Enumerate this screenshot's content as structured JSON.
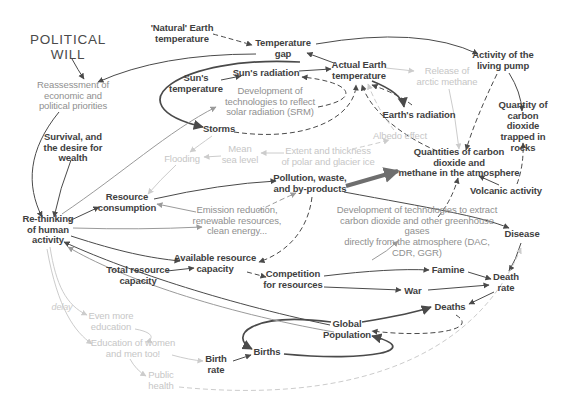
{
  "diagram": {
    "colors": {
      "background": "#ffffff",
      "dark_text": "#3f3f3f",
      "gray_text": "#8f8f8f",
      "light_text": "#c6c6c6",
      "dark_line": "#4a4a4a",
      "gray_line": "#9a9a9a",
      "light_line": "#cccccc",
      "thick_line": "#6e6e6e"
    },
    "nodes": [
      {
        "id": "political-will",
        "label": "POLITICAL\nWILL",
        "x": 68,
        "y": 47,
        "style": "title"
      },
      {
        "id": "natural-earth-temperature",
        "label": "'Natural' Earth\ntemperature",
        "x": 182,
        "y": 34,
        "style": "dark"
      },
      {
        "id": "temperature-gap",
        "label": "Temperature\ngap",
        "x": 283,
        "y": 49,
        "style": "dark"
      },
      {
        "id": "suns-temperature",
        "label": "Sun's\ntemperature",
        "x": 196,
        "y": 84,
        "style": "dark"
      },
      {
        "id": "suns-radiation",
        "label": "Sun's radiation",
        "x": 266,
        "y": 73,
        "style": "dark"
      },
      {
        "id": "actual-earth-temperature",
        "label": "Actual Earth\ntemperature",
        "x": 359,
        "y": 71,
        "style": "dark"
      },
      {
        "id": "release-of-arctic-methane",
        "label": "Release of\narctic methane",
        "x": 447,
        "y": 77,
        "style": "light"
      },
      {
        "id": "activity-of-living-pump",
        "label": "Activity of the\nliving pump",
        "x": 503,
        "y": 61,
        "style": "dark"
      },
      {
        "id": "reassessment-priorities",
        "label": "Reassessment of\neconomic and\npolitical priorities",
        "x": 73,
        "y": 96,
        "style": "gray"
      },
      {
        "id": "srm-technologies",
        "label": "Development of\ntechnologies to reflect\nsolar radiation (SRM)",
        "x": 270,
        "y": 102,
        "style": "gray"
      },
      {
        "id": "earths-radiation",
        "label": "Earth's radiation",
        "x": 419,
        "y": 115,
        "style": "dark"
      },
      {
        "id": "co2-trapped-in-rocks",
        "label": "Quantity of\ncarbon dioxide\ntrapped in rocks",
        "x": 523,
        "y": 127,
        "style": "dark"
      },
      {
        "id": "storms",
        "label": "Storms",
        "x": 219,
        "y": 129,
        "style": "dark"
      },
      {
        "id": "survival-desire-wealth",
        "label": "Survival, and\nthe desire for\nwealth",
        "x": 73,
        "y": 148,
        "style": "dark"
      },
      {
        "id": "albedo-effect",
        "label": "Albedo effect",
        "x": 400,
        "y": 136,
        "style": "light"
      },
      {
        "id": "mean-sea-level",
        "label": "Mean\nsea level",
        "x": 240,
        "y": 155,
        "style": "light"
      },
      {
        "id": "polar-glacier-ice",
        "label": "Extent and thickness\nof polar and glacier ice",
        "x": 328,
        "y": 157,
        "style": "light"
      },
      {
        "id": "flooding",
        "label": "Flooding",
        "x": 182,
        "y": 159,
        "style": "light"
      },
      {
        "id": "co2-methane-atmosphere",
        "label": "Quantities of carbon dioxide and\nmethane in the atmosphere",
        "x": 459,
        "y": 163,
        "style": "dark"
      },
      {
        "id": "pollution-waste",
        "label": "Pollution, waste,\nand by-products",
        "x": 310,
        "y": 184,
        "style": "dark"
      },
      {
        "id": "volcanic-activity",
        "label": "Volcanic activity",
        "x": 506,
        "y": 191,
        "style": "dark"
      },
      {
        "id": "resource-consumption",
        "label": "Resource\nconsumption",
        "x": 127,
        "y": 203,
        "style": "dark"
      },
      {
        "id": "emission-reduction",
        "label": "Emission reduction,\nrenewable resources,\nclean energy...",
        "x": 237,
        "y": 221,
        "style": "gray"
      },
      {
        "id": "rethinking-human-activity",
        "label": "Re-thinking\nof human\nactivity",
        "x": 48,
        "y": 230,
        "style": "dark"
      },
      {
        "id": "dac-technologies",
        "label": "Development of technologies to extract\ncarbon dioxide and other greenhouse gases\ndirectly from the atmosphere (DAC, CDR, GGR)",
        "x": 417,
        "y": 232,
        "style": "gray"
      },
      {
        "id": "disease",
        "label": "Disease",
        "x": 522,
        "y": 234,
        "style": "dark"
      },
      {
        "id": "available-resource-capacity",
        "label": "Available resource\ncapacity",
        "x": 215,
        "y": 264,
        "style": "dark"
      },
      {
        "id": "total-resource-capacity",
        "label": "Total resource\ncapacity",
        "x": 138,
        "y": 276,
        "style": "dark"
      },
      {
        "id": "competition-for-resources",
        "label": "Competition\nfor resources",
        "x": 293,
        "y": 280,
        "style": "dark"
      },
      {
        "id": "famine",
        "label": "Famine",
        "x": 448,
        "y": 270,
        "style": "dark"
      },
      {
        "id": "death-rate",
        "label": "Death\nrate",
        "x": 506,
        "y": 283,
        "style": "dark"
      },
      {
        "id": "war",
        "label": "War",
        "x": 413,
        "y": 291,
        "style": "dark"
      },
      {
        "id": "deaths",
        "label": "Deaths",
        "x": 450,
        "y": 307,
        "style": "dark"
      },
      {
        "id": "delay-note",
        "label": "delay",
        "x": 62,
        "y": 307,
        "style": "lightitalic"
      },
      {
        "id": "even-more-education",
        "label": "Even more\neducation",
        "x": 111,
        "y": 322,
        "style": "light"
      },
      {
        "id": "global-population",
        "label": "Global\nPopulation",
        "x": 347,
        "y": 330,
        "style": "dark"
      },
      {
        "id": "education-of-women",
        "label": "Education of women\nand men too!",
        "x": 133,
        "y": 349,
        "style": "light"
      },
      {
        "id": "births",
        "label": "Births",
        "x": 267,
        "y": 352,
        "style": "dark"
      },
      {
        "id": "birth-rate",
        "label": "Birth\nrate",
        "x": 216,
        "y": 365,
        "style": "dark"
      },
      {
        "id": "public-health",
        "label": "Public\nhealth",
        "x": 161,
        "y": 381,
        "style": "light"
      }
    ],
    "edges": [
      {
        "from": "political-will",
        "to": "reassessment-priorities",
        "style": "sd",
        "d": "M 72 59 Q 78 70 84 79"
      },
      {
        "from": "temperature-gap",
        "to": "reassessment-priorities",
        "style": "sd",
        "d": "M 256 54 Q 160 54 98 82"
      },
      {
        "from": "suns-temperature",
        "to": "suns-radiation",
        "style": "sd",
        "d": "M 221 80 L 241 76"
      },
      {
        "from": "suns-radiation",
        "to": "actual-earth-temperature",
        "style": "sd",
        "d": "M 299 71 L 331 69"
      },
      {
        "from": "actual-earth-temperature",
        "to": "temperature-gap",
        "style": "sd",
        "d": "M 334 63 L 307 53"
      },
      {
        "from": "temperature-gap",
        "to": "activity-of-living-pump",
        "style": "sd",
        "d": "M 316 44 Q 420 26 478 54"
      },
      {
        "from": "natural-earth-temperature",
        "to": "temperature-gap",
        "style": "dd",
        "d": "M 213 34 Q 235 40 252 45"
      },
      {
        "from": "actual-earth-temperature",
        "to": "storms",
        "style": "sdt",
        "d": "M 300 62 C 180 55 110 105 203 127"
      },
      {
        "from": "storms",
        "to": "actual-earth-temperature",
        "style": "dd",
        "d": "M 234 132 C 310 143 355 115 356 85"
      },
      {
        "from": "srm-technologies",
        "to": "suns-radiation",
        "style": "dd",
        "d": "M 318 107 C 362 99 352 82 302 77"
      },
      {
        "from": "resource-consumption",
        "to": "pollution-waste",
        "style": "sd",
        "d": "M 154 199 Q 220 184 276 181"
      },
      {
        "from": "pollution-waste",
        "to": "co2-methane-atmosphere",
        "style": "thick",
        "d": "M 346 186 L 398 171"
      },
      {
        "from": "actual-earth-temperature",
        "to": "earths-radiation",
        "style": "sdt",
        "d": "M 372 81 Q 402 93 404 107"
      },
      {
        "from": "earths-radiation",
        "to": "actual-earth-temperature",
        "style": "dd",
        "d": "M 412 105 Q 398 94 372 85"
      },
      {
        "from": "co2-methane-atmosphere",
        "to": "actual-earth-temperature",
        "style": "dd",
        "d": "M 437 151 C 400 135 370 110 362 85"
      },
      {
        "from": "albedo-effect",
        "to": "actual-earth-temperature",
        "style": "dl",
        "d": "M 394 130 Q 378 110 368 84"
      },
      {
        "from": "polar-glacier-ice",
        "to": "albedo-effect",
        "style": "dl",
        "d": "M 352 149 Q 375 144 389 140"
      },
      {
        "from": "polar-glacier-ice",
        "to": "mean-sea-level",
        "style": "sl",
        "d": "M 284 153 L 261 153"
      },
      {
        "from": "mean-sea-level",
        "to": "flooding",
        "style": "sl",
        "d": "M 221 156 L 204 157"
      },
      {
        "from": "storms",
        "to": "flooding",
        "style": "sl",
        "d": "M 212 136 Q 198 146 190 152"
      },
      {
        "from": "flooding",
        "to": "resource-consumption",
        "style": "sl",
        "d": "M 176 165 Q 160 180 148 194"
      },
      {
        "from": "activity-of-living-pump",
        "to": "co2-trapped-in-rocks",
        "style": "sd",
        "d": "M 509 73 Q 521 92 522 111"
      },
      {
        "from": "activity-of-living-pump",
        "to": "co2-methane-atmosphere",
        "style": "dd",
        "d": "M 497 74 C 482 105 472 130 466 150"
      },
      {
        "from": "volcanic-activity",
        "to": "co2-methane-atmosphere",
        "style": "sd",
        "d": "M 499 185 L 479 176"
      },
      {
        "from": "volcanic-activity",
        "to": "co2-trapped-in-rocks",
        "style": "dd",
        "d": "M 517 184 Q 524 165 523 143"
      },
      {
        "from": "release-of-arctic-methane",
        "to": "co2-methane-atmosphere",
        "style": "sl",
        "d": "M 449 89 Q 456 120 459 149"
      },
      {
        "from": "actual-earth-temperature",
        "to": "release-of-arctic-methane",
        "style": "sl",
        "d": "M 386 68 L 414 71"
      },
      {
        "from": "pollution-waste",
        "to": "disease",
        "style": "sd",
        "d": "M 344 192 C 430 208 480 216 509 228"
      },
      {
        "from": "dac-technologies",
        "to": "co2-methane-atmosphere",
        "style": "dd",
        "d": "M 438 217 Q 452 200 458 178"
      },
      {
        "from": "rethinking-human-activity",
        "to": "dac-technologies",
        "style": "sg",
        "d": "M 372 260 Q 388 251 398 241"
      },
      {
        "from": "disease",
        "to": "death-rate",
        "style": "sd",
        "d": "M 521 243 Q 516 260 509 271"
      },
      {
        "from": "famine",
        "to": "death-rate",
        "style": "sd",
        "d": "M 468 272 L 491 279"
      },
      {
        "from": "war",
        "to": "death-rate",
        "style": "sd",
        "d": "M 428 290 L 489 285"
      },
      {
        "from": "competition-for-resources",
        "to": "famine",
        "style": "sd",
        "d": "M 324 276 Q 390 268 429 270"
      },
      {
        "from": "competition-for-resources",
        "to": "war",
        "style": "sd",
        "d": "M 324 287 L 401 290"
      },
      {
        "from": "available-resource-capacity",
        "to": "competition-for-resources",
        "style": "dd",
        "d": "M 247 272 L 266 277"
      },
      {
        "from": "total-resource-capacity",
        "to": "available-resource-capacity",
        "style": "sd",
        "d": "M 167 271 L 194 268"
      },
      {
        "from": "rethinking-human-activity",
        "to": "resource-consumption",
        "style": "sd",
        "d": "M 69 221 L 99 207"
      },
      {
        "from": "rethinking-human-activity",
        "to": "available-resource-capacity",
        "style": "sd",
        "d": "M 71 236 C 120 252 150 258 180 261"
      },
      {
        "from": "survival-desire-wealth",
        "to": "rethinking-human-activity",
        "style": "sd",
        "d": "M 71 160 Q 60 188 54 217"
      },
      {
        "from": "reassessment-priorities",
        "to": "rethinking-human-activity",
        "style": "sd",
        "d": "M 59 112 C 28 150 26 185 42 217"
      },
      {
        "from": "emission-reduction",
        "to": "resource-consumption",
        "style": "sg",
        "d": "M 196 212 L 157 204"
      },
      {
        "from": "rethinking-human-activity",
        "to": "emission-reduction",
        "style": "sg",
        "d": "M 73 228 Q 140 230 202 227"
      },
      {
        "from": "rethinking-human-activity",
        "to": "srm-technologies",
        "style": "sg",
        "d": "M 62 214 C 120 175 170 130 216 107"
      },
      {
        "from": "emission-reduction",
        "to": "pollution-waste",
        "style": "dg",
        "d": "M 258 211 Q 280 200 296 193"
      },
      {
        "from": "global-population",
        "to": "births",
        "style": "sdt",
        "d": "M 331 322 C 250 312 228 336 252 349"
      },
      {
        "from": "births",
        "to": "global-population",
        "style": "sdt",
        "d": "M 284 354 C 370 362 425 350 372 336"
      },
      {
        "from": "birth-rate",
        "to": "births",
        "style": "sd",
        "d": "M 233 361 L 251 355"
      },
      {
        "from": "global-population",
        "to": "deaths",
        "style": "sdt",
        "d": "M 362 322 C 405 315 420 311 431 307"
      },
      {
        "from": "death-rate",
        "to": "deaths",
        "style": "sd",
        "d": "M 494 292 L 469 304"
      },
      {
        "from": "deaths",
        "to": "global-population",
        "style": "dd",
        "d": "M 456 315 C 480 330 430 338 372 331"
      },
      {
        "from": "pollution-waste",
        "to": "available-resource-capacity",
        "style": "dd",
        "d": "M 312 197 C 308 230 288 252 259 262"
      },
      {
        "from": "global-population",
        "to": "rethinking-human-activity",
        "style": "sd",
        "d": "M 330 325 C 220 302 120 268 64 242"
      },
      {
        "from": "global-population",
        "to": "rethinking-human-activity",
        "style": "sg",
        "d": "M 334 332 C 220 312 120 278 68 247"
      },
      {
        "from": "rethinking-human-activity",
        "to": "even-more-education",
        "style": "sl",
        "d": "M 50 247 C 56 285 66 305 87 315"
      },
      {
        "from": "even-more-education",
        "to": "education-of-women",
        "style": "sl",
        "d": "M 135 329 C 157 333 152 340 146 342"
      },
      {
        "from": "rethinking-human-activity",
        "to": "education-of-women",
        "style": "sl",
        "d": "M 47 249 C 58 310 75 332 92 344"
      },
      {
        "from": "education-of-women",
        "to": "public-health",
        "style": "sl",
        "d": "M 130 359 Q 136 370 146 376"
      },
      {
        "from": "education-of-women",
        "to": "birth-rate",
        "style": "sl",
        "d": "M 172 355 Q 190 360 203 361"
      },
      {
        "from": "public-health",
        "to": "disease",
        "style": "dl",
        "d": "M 179 387 C 330 402 470 370 521 248"
      }
    ]
  }
}
